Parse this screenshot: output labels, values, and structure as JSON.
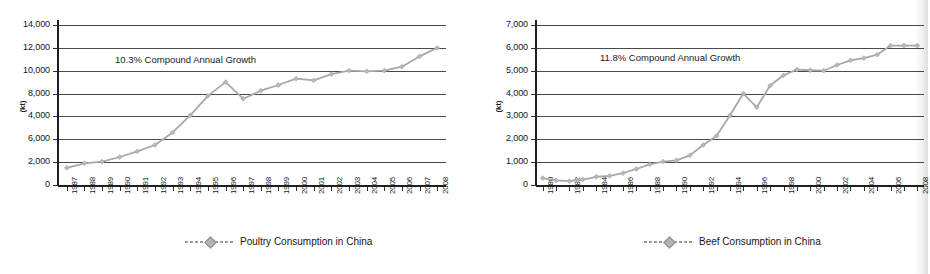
{
  "figure": {
    "kind": "two-panel-line-chart-scan",
    "line_color": "#a8a8a8",
    "marker_color": "#b9b9b9",
    "grid_color": "#4a4a4a",
    "axis_color": "#202020",
    "text_color": "#161616"
  },
  "left": {
    "axis_unit": "(kt)",
    "annotation": "10.3% Compound Annual Growth",
    "legend_label": "Poultry Consumption in China",
    "y_tick_labels": [
      "14,000",
      "12,000",
      "10,000",
      "8,000",
      "4,000",
      "6,000",
      "2,000",
      "0"
    ]
  },
  "right": {
    "axis_unit": "(kt)",
    "annotation": "11.8% Compound Annual Growth",
    "legend_label": "Beef Consumption in China",
    "y_tick_labels": [
      "7,000",
      "6,000",
      "5,000",
      "4,000",
      "3,000",
      "2,000",
      "1,000",
      "0"
    ]
  },
  "chart_data": [
    {
      "type": "line",
      "panel": "left",
      "title": "",
      "xlabel": "",
      "ylabel": "(kt)",
      "legend": [
        "Poultry Consumption in China"
      ],
      "legend_position": "bottom-center",
      "grid": true,
      "annotation": "10.3% Compound Annual Growth",
      "xlim": [
        1987,
        2008
      ],
      "ylim": [
        0,
        14000
      ],
      "ytick_values": [
        0,
        2000,
        4000,
        6000,
        8000,
        10000,
        12000,
        14000
      ],
      "ytick_labels_as_printed": [
        "14,000",
        "12,000",
        "10,000",
        "8,000",
        "4,000",
        "6,000",
        "2,000",
        "0"
      ],
      "ytick_label_note": "As printed in the scan the 6,000 and 4,000 labels appear transposed",
      "x": [
        1987,
        1988,
        1989,
        1990,
        1991,
        1992,
        1993,
        1994,
        1995,
        1996,
        1997,
        1998,
        1999,
        2000,
        2001,
        2002,
        2003,
        2004,
        2005,
        2006,
        2007,
        2008
      ],
      "xtick_labels": [
        "1987",
        "1988",
        "1989",
        "1990",
        "1991",
        "1992",
        "1993",
        "1994",
        "1995",
        "1996",
        "1997",
        "1998",
        "1999",
        "2000",
        "2001",
        "2002",
        "2003",
        "2004",
        "2005",
        "2006",
        "2007",
        "2008"
      ],
      "series": [
        {
          "name": "Poultry Consumption in China",
          "values": [
            1500,
            1900,
            2050,
            2450,
            2950,
            3500,
            4600,
            6100,
            7800,
            9000,
            7550,
            8250,
            8750,
            9300,
            9150,
            9700,
            10000,
            9950,
            10000,
            10350,
            11250,
            12000
          ]
        }
      ]
    },
    {
      "type": "line",
      "panel": "right",
      "title": "",
      "xlabel": "",
      "ylabel": "(kt)",
      "legend": [
        "Beef Consumption in China"
      ],
      "legend_position": "bottom-center",
      "grid": true,
      "annotation": "11.8% Compound Annual Growth",
      "xlim": [
        1980,
        2008
      ],
      "ylim": [
        0,
        7000
      ],
      "ytick_values": [
        0,
        1000,
        2000,
        3000,
        4000,
        5000,
        6000,
        7000
      ],
      "ytick_labels_as_printed": [
        "7,000",
        "6,000",
        "5,000",
        "4,000",
        "3,000",
        "2,000",
        "1,000",
        "0"
      ],
      "x": [
        1980,
        1981,
        1982,
        1983,
        1984,
        1985,
        1986,
        1987,
        1988,
        1989,
        1990,
        1991,
        1992,
        1993,
        1994,
        1995,
        1996,
        1997,
        1998,
        1999,
        2000,
        2001,
        2002,
        2003,
        2004,
        2005,
        2006,
        2007,
        2008
      ],
      "xtick_labels": [
        "1980",
        "",
        "1982",
        "",
        "1984",
        "",
        "1986",
        "",
        "1988",
        "",
        "1990",
        "",
        "1992",
        "",
        "1994",
        "",
        "1996",
        "",
        "1998",
        "",
        "2000",
        "",
        "2002",
        "",
        "2004",
        "",
        "2006",
        "",
        "2008"
      ],
      "series": [
        {
          "name": "Beef Consumption in China",
          "values": [
            300,
            200,
            170,
            240,
            360,
            400,
            520,
            700,
            900,
            1020,
            1080,
            1300,
            1750,
            2150,
            3050,
            4000,
            3400,
            4350,
            4800,
            5050,
            5020,
            5000,
            5250,
            5450,
            5550,
            5700,
            6100,
            6100,
            6100
          ]
        }
      ]
    }
  ]
}
